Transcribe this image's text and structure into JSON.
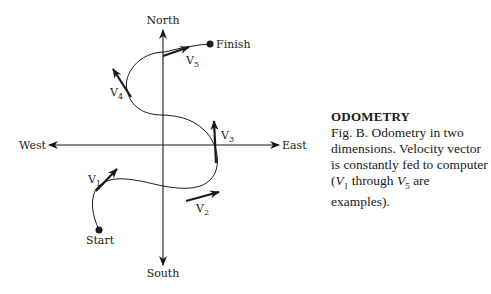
{
  "diagram": {
    "axes": {
      "north": "North",
      "south": "South",
      "east": "East",
      "west": "West"
    },
    "points": {
      "start": "Start",
      "finish": "Finish"
    },
    "vectors": [
      {
        "label": "V",
        "sub": "1"
      },
      {
        "label": "V",
        "sub": "2"
      },
      {
        "label": "V",
        "sub": "3"
      },
      {
        "label": "V",
        "sub": "4"
      },
      {
        "label": "V",
        "sub": "5"
      }
    ],
    "colors": {
      "ink": "#1a1a1a",
      "background": "#ffffff"
    }
  },
  "caption": {
    "title": "ODOMETRY",
    "text_a": "Fig. B. Odometry in two dimensions. Velocity vector is constantly fed to computer (",
    "v1": "V",
    "v1_sub": "1",
    "through": " through ",
    "v5": "V",
    "v5_sub": "5",
    "text_b": " are examples)."
  }
}
